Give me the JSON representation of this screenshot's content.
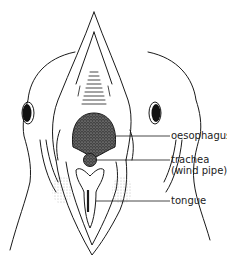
{
  "diagram": {
    "labels": [
      {
        "id": "oesophagus",
        "text": "oesophagus"
      },
      {
        "id": "trachea",
        "text": "trachea",
        "subtext": "(wind pipe)"
      },
      {
        "id": "tongue",
        "text": "tongue"
      }
    ],
    "colors": {
      "ink": "#1a1a1a",
      "background": "#ffffff"
    }
  }
}
